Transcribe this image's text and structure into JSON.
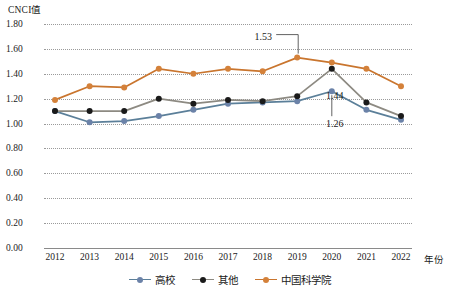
{
  "chart_data": {
    "type": "line",
    "title": "",
    "xlabel": "年份",
    "ylabel": "CNCI值",
    "categories": [
      "2012",
      "2013",
      "2014",
      "2015",
      "2016",
      "2017",
      "2018",
      "2019",
      "2020",
      "2021",
      "2022"
    ],
    "x": [
      2012,
      2013,
      2014,
      2015,
      2016,
      2017,
      2018,
      2019,
      2020,
      2021,
      2022
    ],
    "ylim": [
      0.0,
      1.8
    ],
    "ytick_step": 0.2,
    "ytick_labels": [
      "0.00",
      "0.20",
      "0.40",
      "0.60",
      "0.80",
      "1.00",
      "1.20",
      "1.40",
      "1.60",
      "1.80"
    ],
    "grid": true,
    "grid_style": "dotted-horizontal",
    "legend_position": "bottom-center",
    "series": [
      {
        "name": "高校",
        "color": "#5b7f99",
        "marker_color": "#6b82a8",
        "values": [
          1.1,
          1.01,
          1.02,
          1.06,
          1.11,
          1.16,
          1.17,
          1.18,
          1.26,
          1.11,
          1.03
        ]
      },
      {
        "name": "其他",
        "color": "#8d8a82",
        "marker_color": "#1a1a1a",
        "values": [
          1.1,
          1.1,
          1.1,
          1.2,
          1.16,
          1.19,
          1.18,
          1.22,
          1.44,
          1.17,
          1.06
        ]
      },
      {
        "name": "中国科学院",
        "color": "#c9752e",
        "marker_color": "#d4813a",
        "values": [
          1.19,
          1.3,
          1.29,
          1.44,
          1.4,
          1.44,
          1.42,
          1.53,
          1.49,
          1.44,
          1.3
        ]
      }
    ],
    "annotations": [
      {
        "label": "1.53",
        "series": "中国科学院",
        "x": 2019,
        "value": 1.53
      },
      {
        "label": "1.44",
        "series": "其他",
        "x": 2020,
        "value": 1.44
      },
      {
        "label": "1.26",
        "series": "高校",
        "x": 2020,
        "value": 1.26
      }
    ]
  },
  "legend": {
    "items": [
      {
        "label": "高校"
      },
      {
        "label": "其他"
      },
      {
        "label": "中国科学院"
      }
    ]
  }
}
